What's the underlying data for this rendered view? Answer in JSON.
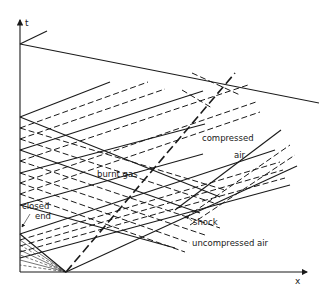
{
  "diagram": {
    "type": "x-t wave diagram",
    "axes": {
      "vertical_label": "t",
      "horizontal_label": "x"
    },
    "labels": {
      "burnt_gas": "burnt gas",
      "compressed_air_line1": "compressed",
      "compressed_air_line2": "air",
      "closed_end_line1": "closed",
      "closed_end_line2": "end",
      "shock": "shock",
      "uncompressed_air": "uncompressed air"
    },
    "colors": {
      "ink": "#1a1a1a",
      "background": "#ffffff"
    }
  }
}
